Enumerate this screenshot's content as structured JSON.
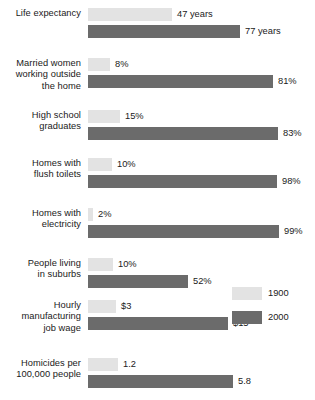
{
  "chart_data": {
    "type": "bar",
    "orientation": "horizontal",
    "title": "",
    "xlabel": "",
    "ylabel": "",
    "grid": false,
    "legend_position": "right",
    "categories": [
      "Life expectancy",
      "Married women\nworking outside\nthe home",
      "High school\ngraduates",
      "Homes with\nflush toilets",
      "Homes with\nelectricity",
      "People living\nin suburbs",
      "Hourly\nmanufacturing\njob wage",
      "Homicides per\n100,000 people"
    ],
    "series": [
      {
        "name": "1900",
        "color": "#e3e3e3",
        "values": [
          47,
          8,
          15,
          10,
          2,
          10,
          3,
          1.2
        ],
        "labels": [
          "47 years",
          "8%",
          "15%",
          "10%",
          "2%",
          "10%",
          "$3",
          "1.2"
        ],
        "bar_px": [
          84,
          22,
          32,
          24,
          5,
          25,
          28,
          30
        ]
      },
      {
        "name": "2000",
        "color": "#6b6b6b",
        "values": [
          77,
          81,
          83,
          98,
          99,
          52,
          15,
          5.8
        ],
        "labels": [
          "77 years",
          "81%",
          "83%",
          "98%",
          "99%",
          "52%",
          "$15",
          "5.8"
        ],
        "bar_px": [
          152,
          185,
          190,
          189,
          191,
          100,
          140,
          145
        ]
      }
    ],
    "rows": [
      {
        "label": "Life expectancy",
        "top": 8,
        "v1900": {
          "label": "47 years",
          "width": 84
        },
        "v2000": {
          "label": "77 years",
          "width": 152
        }
      },
      {
        "label": "Married women\nworking outside\nthe home",
        "top": 58,
        "v1900": {
          "label": "8%",
          "width": 22
        },
        "v2000": {
          "label": "81%",
          "width": 185
        }
      },
      {
        "label": "High school\ngraduates",
        "top": 110,
        "v1900": {
          "label": "15%",
          "width": 32
        },
        "v2000": {
          "label": "83%",
          "width": 190
        }
      },
      {
        "label": "Homes with\nflush toilets",
        "top": 158,
        "v1900": {
          "label": "10%",
          "width": 24
        },
        "v2000": {
          "label": "98%",
          "width": 189
        }
      },
      {
        "label": "Homes with\nelectricity",
        "top": 208,
        "v1900": {
          "label": "2%",
          "width": 5
        },
        "v2000": {
          "label": "99%",
          "width": 191
        }
      },
      {
        "label": "People living\nin suburbs",
        "top": 258,
        "v1900": {
          "label": "10%",
          "width": 25
        },
        "v2000": {
          "label": "52%",
          "width": 100
        }
      },
      {
        "label": "Hourly\nmanufacturing\njob wage",
        "top": 300,
        "v1900": {
          "label": "$3",
          "width": 28
        },
        "v2000": {
          "label": "$15",
          "width": 140
        }
      },
      {
        "label": "Homicides per\n100,000 people",
        "top": 358,
        "v1900": {
          "label": "1.2",
          "width": 30
        },
        "v2000": {
          "label": "5.8",
          "width": 145
        }
      }
    ],
    "legend": [
      {
        "name": "1900",
        "color": "#e3e3e3"
      },
      {
        "name": "2000",
        "color": "#6b6b6b"
      }
    ]
  }
}
